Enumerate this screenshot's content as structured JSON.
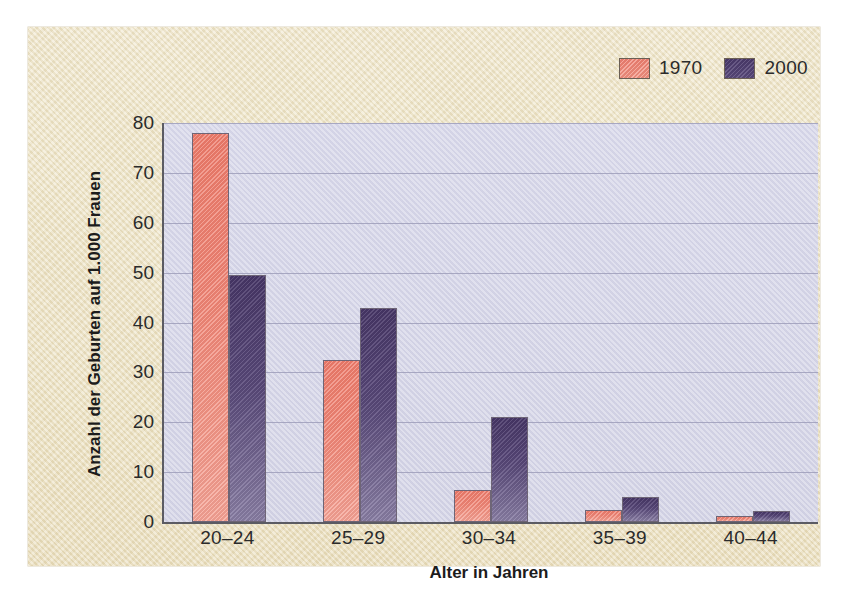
{
  "chart_data": {
    "type": "bar",
    "title": "",
    "xlabel": "Alter in Jahren",
    "ylabel": "Anzahl der Geburten auf 1.000 Frauen",
    "categories": [
      "20–24",
      "25–29",
      "30–34",
      "35–39",
      "40–44"
    ],
    "series": [
      {
        "name": "1970",
        "color": "#f08575",
        "values": [
          78,
          32.5,
          6.5,
          2.5,
          1.2
        ]
      },
      {
        "name": "2000",
        "color": "#4b3a6d",
        "values": [
          49.5,
          43,
          21,
          5,
          2.3
        ]
      }
    ],
    "ylim": [
      0,
      80
    ],
    "yticks": [
      0,
      10,
      20,
      30,
      40,
      50,
      60,
      70,
      80
    ],
    "ytick_labels": [
      "0",
      "10",
      "20",
      "30",
      "40",
      "50",
      "60",
      "70",
      "80"
    ],
    "grid": true,
    "legend_position": "top-right",
    "plot_background": "#d5d5e8",
    "figure_background": "#ece2c2"
  }
}
